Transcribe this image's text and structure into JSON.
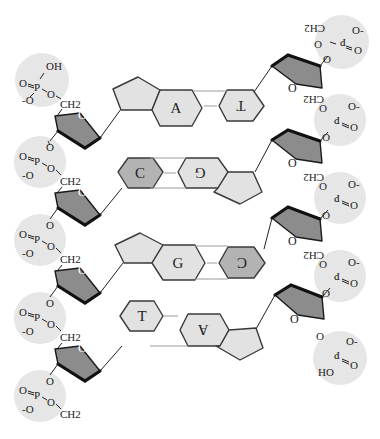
{
  "diagram": {
    "colors": {
      "phosphate_bg": "#e6e6e6",
      "sugar_fill": "#8c8c8c",
      "purine_fill": "#e2e2e2",
      "pyrimidine_c_fill": "#b3b3b3",
      "stroke": "#3a3a3a"
    },
    "base_pairs": [
      {
        "left": "A",
        "right": "T",
        "left_rotated": false,
        "right_rotated": true
      },
      {
        "left": "C",
        "right": "G",
        "left_rotated": false,
        "right_rotated": true
      },
      {
        "left": "G",
        "right": "C",
        "left_rotated": false,
        "right_rotated": true
      },
      {
        "left": "T",
        "right": "A",
        "left_rotated": false,
        "right_rotated": true
      }
    ],
    "left_strand": {
      "phosphates": [
        {
          "top": "OH",
          "double_o": "O",
          "neg_o": "-O",
          "p": "P",
          "link_o": "O",
          "ch2": "CH2"
        },
        {
          "double_o": "O",
          "neg_o": "-O",
          "p": "P",
          "link_o": "O",
          "ch2": "CH2",
          "top_o": "O"
        },
        {
          "double_o": "O",
          "neg_o": "-O",
          "p": "P",
          "link_o": "O",
          "ch2": "CH2",
          "top_o": "O"
        },
        {
          "double_o": "O",
          "neg_o": "-O",
          "p": "P",
          "link_o": "O",
          "ch2": "CH2",
          "top_o": "O"
        },
        {
          "double_o": "O",
          "neg_o": "-O",
          "p": "P",
          "link_o": "O",
          "ch2": "CH2",
          "top_o": "O"
        }
      ],
      "sugar_o": "O"
    },
    "right_strand": {
      "phosphates": [
        {
          "neg_o": "O-",
          "double_o": "O",
          "p": "P",
          "link_o": "O",
          "ch2": "CH2"
        },
        {
          "neg_o": "O-",
          "double_o": "O",
          "p": "P",
          "link_o": "O",
          "ch2": "CH2"
        },
        {
          "neg_o": "O-",
          "double_o": "O",
          "p": "P",
          "link_o": "O",
          "ch2": "CH2"
        },
        {
          "neg_o": "O-",
          "double_o": "O",
          "p": "P",
          "link_o": "O",
          "ch2": "CH2"
        },
        {
          "neg_o": "O-",
          "double_o": "O",
          "p": "P",
          "link_o": "O",
          "bottom": "HO"
        }
      ],
      "sugar_o": "O"
    }
  }
}
